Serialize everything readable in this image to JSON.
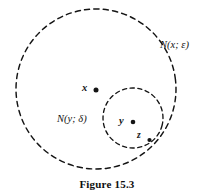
{
  "figure": {
    "caption": "Figure 15.3",
    "background_color": "#ffffff",
    "ink_color": "#141414"
  },
  "diagram": {
    "type": "point-set-topology-neighborhood-diagram",
    "stroke_style": "dashed",
    "circles": [
      {
        "name": "outer-neighborhood",
        "label": "N(x; ε)",
        "center_label": "x",
        "cx": 96,
        "cy": 89,
        "r": 80,
        "dash": "5 4",
        "stroke_width": 1.4
      },
      {
        "name": "inner-neighborhood",
        "label": "N(y; δ)",
        "center_label": "y",
        "cx": 133,
        "cy": 118,
        "r": 30,
        "dash": "4 3.4",
        "stroke_width": 1.3
      }
    ],
    "points": [
      {
        "name": "point-x",
        "label": "x",
        "cx": 96,
        "cy": 90,
        "r": 2.4
      },
      {
        "name": "point-y",
        "label": "y",
        "cx": 133,
        "cy": 122,
        "r": 2.2
      },
      {
        "name": "point-z",
        "label": "z",
        "cx": 149,
        "cy": 140,
        "r": 2.0
      }
    ],
    "labels": {
      "outer_circle": "N(x; ε)",
      "inner_circle": "N(y; δ)",
      "point_x": "x",
      "point_y": "y",
      "point_z": "z"
    }
  }
}
